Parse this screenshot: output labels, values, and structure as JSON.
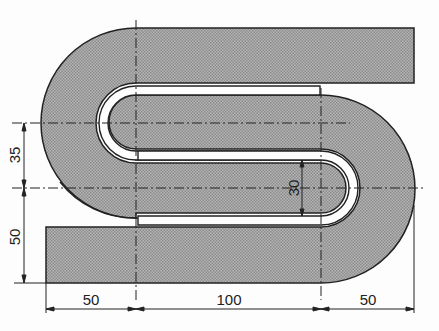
{
  "drawing": {
    "type": "technical-drawing",
    "part": "S-shaped bent strip",
    "fill_color": "#a8a8a8",
    "line_color": "#222222"
  },
  "dimensions": {
    "bottom_left": "50",
    "bottom_middle": "100",
    "bottom_right": "50",
    "left_upper": "35",
    "left_lower": "50",
    "inner_slot": "30"
  }
}
